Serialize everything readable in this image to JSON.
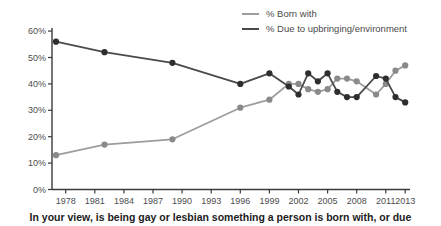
{
  "caption": "In your view, is being gay or lesbian something a person is born with, or due",
  "colors": {
    "axis": "#3a3a3a",
    "tick_label": "#4d4d4d",
    "legend_text": "#4a4a4a",
    "caption_text": "#1c1c1c",
    "background": "#ffffff"
  },
  "chart_data": {
    "type": "line",
    "title": "",
    "xlabel": "",
    "ylabel": "",
    "grid": false,
    "legend_position": "top-right",
    "x": [
      1977,
      1982,
      1989,
      1996,
      1999,
      2001,
      2002,
      2003,
      2004,
      2005,
      2006,
      2007,
      2008,
      2010,
      2011,
      2012,
      2013
    ],
    "series": [
      {
        "name": "% Born with",
        "color": "#9d9d9d",
        "dot_color": "#8a8a8a",
        "values": [
          13,
          17,
          19,
          31,
          34,
          40,
          40,
          38,
          37,
          38,
          42,
          42,
          41,
          36,
          40,
          45,
          47
        ]
      },
      {
        "name": "% Due to upbringing/environment",
        "color": "#4a4a4a",
        "dot_color": "#2e2e2e",
        "values": [
          56,
          52,
          48,
          40,
          44,
          39,
          36,
          44,
          41,
          44,
          37,
          35,
          35,
          43,
          42,
          35,
          33
        ]
      }
    ],
    "xtick_years": [
      1978,
      1981,
      1984,
      1987,
      1990,
      1993,
      1996,
      1999,
      2002,
      2005,
      2008,
      2011,
      2013
    ],
    "ytick_labels": [
      "0%",
      "10%",
      "20%",
      "30%",
      "40%",
      "50%",
      "60%"
    ],
    "ytick_values": [
      0,
      10,
      20,
      30,
      40,
      50,
      60
    ],
    "ylim": [
      0,
      60
    ],
    "xlim": [
      1976.5,
      2013.5
    ]
  }
}
